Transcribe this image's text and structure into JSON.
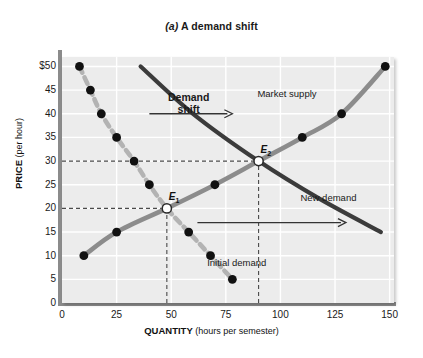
{
  "figure": {
    "label": "(a)",
    "title": "A demand shift"
  },
  "axes": {
    "y": {
      "title_bold": "PRICE",
      "title_rest": " (per hour)",
      "ticks": [
        "$50",
        "45",
        "40",
        "35",
        "30",
        "25",
        "20",
        "15",
        "10",
        "5",
        "0"
      ],
      "tick_values": [
        50,
        45,
        40,
        35,
        30,
        25,
        20,
        15,
        10,
        5,
        0
      ],
      "min": 0,
      "max": 52
    },
    "x": {
      "title_bold": "QUANTITY",
      "title_rest": " (hours per semester)",
      "ticks": [
        "0",
        "25",
        "50",
        "75",
        "100",
        "125",
        "150"
      ],
      "tick_values": [
        0,
        25,
        50,
        75,
        100,
        125,
        150
      ],
      "min": 0,
      "max": 152
    }
  },
  "annotations": {
    "market_supply": "Market supply",
    "new_demand": "New demand",
    "initial_demand": "Initial demand",
    "demand_shift_line1": "Demand",
    "demand_shift_line2": "shift",
    "e1": "E",
    "e1_sub": "1",
    "e2": "E",
    "e2_sub": "2"
  },
  "colors": {
    "plot_background": "#ececec",
    "gridline": "#ffffff",
    "supply_curve": "#8c8c8c",
    "initial_demand_curve": "#b3b3b3",
    "new_demand_curve": "#3b3b3b",
    "point_fill": "#111111",
    "equilibrium_fill": "#ffffff",
    "axis": "#8b8b8b",
    "dashed_guide": "#4a4a4a",
    "text": "#1a1a1a"
  },
  "chart_data": {
    "type": "line",
    "title": "(a) A demand shift",
    "xlabel": "QUANTITY (hours per semester)",
    "ylabel": "PRICE (per hour)",
    "xlim": [
      0,
      152
    ],
    "ylim": [
      0,
      52
    ],
    "grid": true,
    "legend_position": "inline-annotations",
    "series": [
      {
        "name": "Market supply",
        "style": "solid-gray-thick",
        "color": "#8c8c8c",
        "markers": true,
        "points": [
          {
            "x": 10,
            "y": 10
          },
          {
            "x": 25,
            "y": 15
          },
          {
            "x": 48,
            "y": 20
          },
          {
            "x": 70,
            "y": 25
          },
          {
            "x": 90,
            "y": 30
          },
          {
            "x": 110,
            "y": 35
          },
          {
            "x": 128,
            "y": 40
          },
          {
            "x": 148,
            "y": 50
          }
        ]
      },
      {
        "name": "Initial demand",
        "style": "dashed-lightgray-thick",
        "color": "#b3b3b3",
        "markers": true,
        "points": [
          {
            "x": 8,
            "y": 50
          },
          {
            "x": 13,
            "y": 45
          },
          {
            "x": 18,
            "y": 40
          },
          {
            "x": 25,
            "y": 35
          },
          {
            "x": 33,
            "y": 30
          },
          {
            "x": 40,
            "y": 25
          },
          {
            "x": 48,
            "y": 20
          },
          {
            "x": 58,
            "y": 15
          },
          {
            "x": 68,
            "y": 10
          },
          {
            "x": 78,
            "y": 5
          }
        ]
      },
      {
        "name": "New demand",
        "style": "solid-dark-thick",
        "color": "#3b3b3b",
        "markers": false,
        "points": [
          {
            "x": 36,
            "y": 50
          },
          {
            "x": 60,
            "y": 40
          },
          {
            "x": 90,
            "y": 30
          },
          {
            "x": 118,
            "y": 22
          },
          {
            "x": 146,
            "y": 15
          }
        ]
      }
    ],
    "equilibria": [
      {
        "label": "E1",
        "x": 48,
        "y": 20,
        "marker": "hollow-circle"
      },
      {
        "label": "E2",
        "x": 90,
        "y": 30,
        "marker": "hollow-circle"
      }
    ],
    "guides": [
      {
        "type": "horizontal-dashed",
        "y": 30,
        "from_x": 0,
        "to_x": 90
      },
      {
        "type": "horizontal-dashed",
        "y": 20,
        "from_x": 0,
        "to_x": 48
      },
      {
        "type": "vertical-dashed",
        "x": 48,
        "from_y": 0,
        "to_y": 20
      },
      {
        "type": "vertical-dashed",
        "x": 90,
        "from_y": 0,
        "to_y": 30
      }
    ],
    "arrows": [
      {
        "name": "demand-shift-arrow-upper",
        "from_x": 40,
        "to_x": 78,
        "y": 40
      },
      {
        "name": "demand-shift-arrow-lower",
        "from_x": 62,
        "to_x": 130,
        "y": 17
      }
    ]
  }
}
